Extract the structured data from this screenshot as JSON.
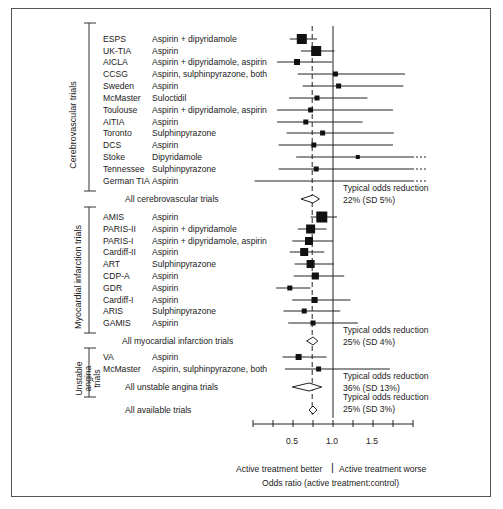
{
  "chart_data": {
    "type": "forest",
    "title": "",
    "xlabel": "Odds ratio (active treatment:control)",
    "x_direction_labels": {
      "left": "Active treatment better",
      "right": "Active treatment worse"
    },
    "xlim": [
      0,
      2.0
    ],
    "xticks": [
      0,
      0.25,
      0.5,
      0.75,
      1.0,
      1.25,
      1.5,
      1.75,
      2.0
    ],
    "xtick_labels": [
      {
        "value": 0.5,
        "label": "0.5"
      },
      {
        "value": 1.0,
        "label": "1.0"
      },
      {
        "value": 1.5,
        "label": "1.5"
      }
    ],
    "reference_lines": [
      {
        "value": 1.0,
        "style": "solid"
      },
      {
        "value": 0.74,
        "style": "dashed"
      }
    ],
    "groups": [
      {
        "name": "Cerebrovascular trials",
        "trials": [
          {
            "trial": "ESPS",
            "treatment": "Aspirin + dipyridamole",
            "or": 0.61,
            "lo": 0.46,
            "hi": 0.8,
            "size": 10
          },
          {
            "trial": "UK-TIA",
            "treatment": "Aspirin",
            "or": 0.79,
            "lo": 0.6,
            "hi": 1.02,
            "size": 10
          },
          {
            "trial": "AICLA",
            "treatment": "Aspirin + dipyridamole, aspirin",
            "or": 0.55,
            "lo": 0.3,
            "hi": 0.99,
            "size": 6
          },
          {
            "trial": "CCSG",
            "treatment": "Aspirin, sulphinpyrazone, both",
            "or": 1.03,
            "lo": 0.56,
            "hi": 1.9,
            "size": 5
          },
          {
            "trial": "Sweden",
            "treatment": "Aspirin",
            "or": 1.07,
            "lo": 0.62,
            "hi": 1.88,
            "size": 5
          },
          {
            "trial": "McMaster",
            "treatment": "Suloctidil",
            "or": 0.8,
            "lo": 0.45,
            "hi": 1.43,
            "size": 5
          },
          {
            "trial": "Toulouse",
            "treatment": "Aspirin + dipyridamole, aspirin",
            "or": 0.72,
            "lo": 0.3,
            "hi": 1.75,
            "size": 5
          },
          {
            "trial": "AITIA",
            "treatment": "Aspirin",
            "or": 0.66,
            "lo": 0.3,
            "hi": 1.37,
            "size": 5
          },
          {
            "trial": "Toronto",
            "treatment": "Sulphinpyrazone",
            "or": 0.87,
            "lo": 0.42,
            "hi": 1.76,
            "size": 5
          },
          {
            "trial": "DCS",
            "treatment": "Aspirin",
            "or": 0.76,
            "lo": 0.32,
            "hi": 1.75,
            "size": 5
          },
          {
            "trial": "Stoke",
            "treatment": "Dipyridamole",
            "or": 1.31,
            "lo": 0.54,
            "hi": 2.0,
            "size": 4,
            "hi_truncated": true
          },
          {
            "trial": "Tennessee",
            "treatment": "Sulphinpyrazone",
            "or": 0.79,
            "lo": 0.32,
            "hi": 2.0,
            "size": 5,
            "hi_truncated": true
          },
          {
            "trial": "German TIA",
            "treatment": "Aspirin",
            "or": null,
            "lo": 0.02,
            "hi": 2.0,
            "size": 0,
            "hi_truncated": true
          }
        ],
        "summary": {
          "label": "All cerebrovascular trials",
          "or": 0.75,
          "lo": 0.6,
          "hi": 0.83,
          "note_line1": "Typical odds reduction",
          "note_line2": "22% (SD 5%)"
        }
      },
      {
        "name": "Myocardial infarction trials",
        "trials": [
          {
            "trial": "AMIS",
            "treatment": "Aspirin",
            "or": 0.86,
            "lo": 0.72,
            "hi": 1.05,
            "size": 11
          },
          {
            "trial": "PARIS-II",
            "treatment": "Aspirin + dipyridamole",
            "or": 0.72,
            "lo": 0.56,
            "hi": 0.92,
            "size": 9
          },
          {
            "trial": "PARIS-I",
            "treatment": "Aspirin + dipyridamole, aspirin",
            "or": 0.7,
            "lo": 0.49,
            "hi": 1.0,
            "size": 8
          },
          {
            "trial": "Cardiff-II",
            "treatment": "Aspirin",
            "or": 0.64,
            "lo": 0.46,
            "hi": 0.89,
            "size": 8
          },
          {
            "trial": "ART",
            "treatment": "Sulphinpyrazone",
            "or": 0.72,
            "lo": 0.52,
            "hi": 1.01,
            "size": 8
          },
          {
            "trial": "CDP-A",
            "treatment": "Aspirin",
            "or": 0.78,
            "lo": 0.51,
            "hi": 1.14,
            "size": 7
          },
          {
            "trial": "GDR",
            "treatment": "Aspirin",
            "or": 0.46,
            "lo": 0.29,
            "hi": 0.72,
            "size": 5
          },
          {
            "trial": "Cardiff-I",
            "treatment": "Aspirin",
            "or": 0.77,
            "lo": 0.49,
            "hi": 1.22,
            "size": 6
          },
          {
            "trial": "ARIS",
            "treatment": "Sulphinpyrazone",
            "or": 0.64,
            "lo": 0.38,
            "hi": 1.09,
            "size": 5
          },
          {
            "trial": "GAMIS",
            "treatment": "Aspirin",
            "or": 0.75,
            "lo": 0.44,
            "hi": 1.31,
            "size": 5
          }
        ],
        "summary": {
          "label": "All myocardial infarction trials",
          "or": 0.75,
          "lo": 0.67,
          "hi": 0.81,
          "note_line1": "Typical odds reduction",
          "note_line2": "25% (SD 4%)"
        }
      },
      {
        "name": "Unstable angina trials",
        "trials": [
          {
            "trial": "VA",
            "treatment": "Aspirin",
            "or": 0.57,
            "lo": 0.37,
            "hi": 0.92,
            "size": 6
          },
          {
            "trial": "McMaster",
            "treatment": "Aspirin, sulphinpyrazone, both",
            "or": 0.82,
            "lo": 0.4,
            "hi": 1.71,
            "size": 5
          }
        ],
        "summary": {
          "label": "All unstable angina trials",
          "or": 0.7,
          "lo": 0.49,
          "hi": 0.86,
          "note_line1": "Typical odds reduction",
          "note_line2": "36% (SD 13%)"
        }
      }
    ],
    "overall": {
      "label": "All available trials",
      "or": 0.75,
      "lo": 0.7,
      "hi": 0.8,
      "note_line1": "Typical odds reduction",
      "note_line2": "25% (SD 3%)"
    }
  },
  "labels": {
    "group1": "Cerebrovascular trials",
    "group2": "Myocardial infarction trials",
    "group3_line1": "Unstable",
    "group3_line2": "angina",
    "group3_line3": "trials",
    "tick_05": "0.5",
    "tick_10": "1.0",
    "tick_15": "1.5",
    "better": "Active treatment better",
    "worse": "Active treatment worse",
    "xlabel": "Odds ratio (active treatment:control)"
  }
}
